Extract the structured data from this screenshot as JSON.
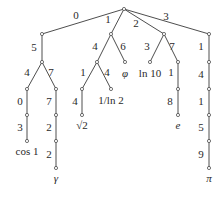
{
  "diagram": {
    "type": "digit-trie",
    "root": {
      "x": 124,
      "y": 9
    },
    "nodes": [
      {
        "id": "root",
        "x": 124,
        "y": 9
      },
      {
        "id": "n0",
        "x": 42,
        "y": 34
      },
      {
        "id": "n05",
        "x": 42,
        "y": 62
      },
      {
        "id": "n054",
        "x": 27,
        "y": 89
      },
      {
        "id": "n0540",
        "x": 27,
        "y": 115
      },
      {
        "id": "n05403",
        "x": 27,
        "y": 141
      },
      {
        "id": "n057",
        "x": 56,
        "y": 89
      },
      {
        "id": "n0577",
        "x": 56,
        "y": 115
      },
      {
        "id": "n05772",
        "x": 56,
        "y": 141
      },
      {
        "id": "n057722",
        "x": 56,
        "y": 168
      },
      {
        "id": "n1",
        "x": 111,
        "y": 34
      },
      {
        "id": "n14",
        "x": 97,
        "y": 62
      },
      {
        "id": "n141",
        "x": 82,
        "y": 89
      },
      {
        "id": "n1414",
        "x": 82,
        "y": 115
      },
      {
        "id": "n144",
        "x": 111,
        "y": 89
      },
      {
        "id": "n16",
        "x": 125,
        "y": 62
      },
      {
        "id": "n2",
        "x": 164,
        "y": 34
      },
      {
        "id": "n23",
        "x": 150,
        "y": 62
      },
      {
        "id": "n27",
        "x": 178,
        "y": 62
      },
      {
        "id": "n271",
        "x": 178,
        "y": 89
      },
      {
        "id": "n2718",
        "x": 178,
        "y": 115
      },
      {
        "id": "n3",
        "x": 209,
        "y": 34
      },
      {
        "id": "n31",
        "x": 209,
        "y": 62
      },
      {
        "id": "n314",
        "x": 209,
        "y": 89
      },
      {
        "id": "n3141",
        "x": 209,
        "y": 115
      },
      {
        "id": "n31415",
        "x": 209,
        "y": 141
      },
      {
        "id": "n314159",
        "x": 209,
        "y": 168
      }
    ],
    "edges": [
      {
        "from": "root",
        "to": "n0",
        "label": "0",
        "lx": 76,
        "ly": 19
      },
      {
        "from": "n0",
        "to": "n05",
        "label": "5",
        "lx": 34,
        "ly": 51
      },
      {
        "from": "n05",
        "to": "n054",
        "label": "4",
        "lx": 27,
        "ly": 76
      },
      {
        "from": "n054",
        "to": "n0540",
        "label": "0",
        "lx": 20,
        "ly": 105
      },
      {
        "from": "n0540",
        "to": "n05403",
        "label": "3",
        "lx": 20,
        "ly": 131
      },
      {
        "from": "n05",
        "to": "n057",
        "label": "7",
        "lx": 51,
        "ly": 76
      },
      {
        "from": "n057",
        "to": "n0577",
        "label": "7",
        "lx": 49,
        "ly": 105
      },
      {
        "from": "n0577",
        "to": "n05772",
        "label": "2",
        "lx": 49,
        "ly": 131
      },
      {
        "from": "n05772",
        "to": "n057722",
        "label": "2",
        "lx": 49,
        "ly": 158
      },
      {
        "from": "root",
        "to": "n1",
        "label": "1",
        "lx": 108,
        "ly": 23
      },
      {
        "from": "n1",
        "to": "n14",
        "label": "4",
        "lx": 95,
        "ly": 50
      },
      {
        "from": "n14",
        "to": "n141",
        "label": "1",
        "lx": 83,
        "ly": 76
      },
      {
        "from": "n141",
        "to": "n1414",
        "label": "4",
        "lx": 75,
        "ly": 105
      },
      {
        "from": "n14",
        "to": "n144",
        "label": "4",
        "lx": 107,
        "ly": 76
      },
      {
        "from": "n1",
        "to": "n16",
        "label": "6",
        "lx": 123,
        "ly": 50
      },
      {
        "from": "root",
        "to": "n2",
        "label": "2",
        "lx": 136,
        "ly": 27
      },
      {
        "from": "n2",
        "to": "n23",
        "label": "3",
        "lx": 147,
        "ly": 50
      },
      {
        "from": "n2",
        "to": "n27",
        "label": "7",
        "lx": 172,
        "ly": 50
      },
      {
        "from": "n27",
        "to": "n271",
        "label": "1",
        "lx": 171,
        "ly": 76
      },
      {
        "from": "n271",
        "to": "n2718",
        "label": "8",
        "lx": 170,
        "ly": 105
      },
      {
        "from": "root",
        "to": "n3",
        "label": "3",
        "lx": 166,
        "ly": 20
      },
      {
        "from": "n3",
        "to": "n31",
        "label": "1",
        "lx": 201,
        "ly": 50
      },
      {
        "from": "n31",
        "to": "n314",
        "label": "4",
        "lx": 201,
        "ly": 78
      },
      {
        "from": "n314",
        "to": "n3141",
        "label": "1",
        "lx": 201,
        "ly": 105
      },
      {
        "from": "n3141",
        "to": "n31415",
        "label": "5",
        "lx": 201,
        "ly": 131
      },
      {
        "from": "n31415",
        "to": "n314159",
        "label": "9",
        "lx": 201,
        "ly": 158
      }
    ],
    "leaves": [
      {
        "node": "n05403",
        "label": "cos 1",
        "x": 27,
        "y": 155,
        "italic": false
      },
      {
        "node": "n057722",
        "label": "γ",
        "x": 56,
        "y": 182,
        "italic": true
      },
      {
        "node": "n1414",
        "label": "√2",
        "x": 82,
        "y": 129,
        "italic": false
      },
      {
        "node": "n144",
        "label": "1/ln 2",
        "x": 111,
        "y": 104,
        "italic": false
      },
      {
        "node": "n16",
        "label": "φ",
        "x": 125,
        "y": 77,
        "italic": true
      },
      {
        "node": "n23",
        "label": "ln 10",
        "x": 150,
        "y": 77,
        "italic": false
      },
      {
        "node": "n2718",
        "label": "e",
        "x": 178,
        "y": 129,
        "italic": true
      },
      {
        "node": "n314159",
        "label": "π",
        "x": 209,
        "y": 182,
        "italic": true
      }
    ]
  }
}
